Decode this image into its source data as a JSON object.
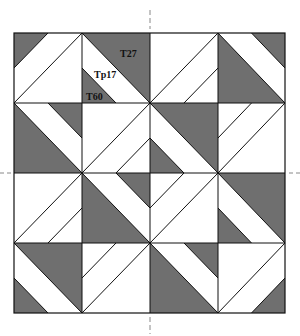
{
  "diagram": {
    "type": "quilt-block-pattern",
    "grid": {
      "rows": 4,
      "cols": 4
    },
    "bounds": {
      "x": [
        14,
        82,
        150,
        218,
        285
      ],
      "y": [
        33,
        103,
        173,
        243,
        313
      ]
    },
    "colors": {
      "dark": "#6f6f6f",
      "light": "#ffffff",
      "line": "#111111",
      "guide": "#888888"
    },
    "guides": {
      "vertical_x": 150,
      "horizontal_y": 173
    },
    "labels": [
      {
        "text": "T27",
        "x": 120,
        "y": 57
      },
      {
        "text": "Tp17",
        "x": 94,
        "y": 78
      },
      {
        "text": "T60",
        "x": 86,
        "y": 100
      }
    ],
    "cells": [
      {
        "r": 0,
        "c": 0,
        "diag": "BL-TR",
        "stripe": "TL",
        "dark_big": null,
        "dark_small": "TL"
      },
      {
        "r": 0,
        "c": 1,
        "diag": "TL-BR",
        "stripe": "BL",
        "dark_big": "TR",
        "dark_small": "BL"
      },
      {
        "r": 0,
        "c": 2,
        "diag": "BL-TR",
        "stripe": "BR",
        "dark_big": null,
        "dark_small": null
      },
      {
        "r": 0,
        "c": 3,
        "diag": "TL-BR",
        "stripe": "TR",
        "dark_big": "BL",
        "dark_small": "TR"
      },
      {
        "r": 1,
        "c": 0,
        "diag": "TL-BR",
        "stripe": "TR",
        "dark_big": "BL",
        "dark_small": "TR"
      },
      {
        "r": 1,
        "c": 1,
        "diag": "BL-TR",
        "stripe": "BR",
        "dark_big": null,
        "dark_small": null
      },
      {
        "r": 1,
        "c": 2,
        "diag": "TL-BR",
        "stripe": "BL",
        "dark_big": "TR",
        "dark_small": "BL"
      },
      {
        "r": 1,
        "c": 3,
        "diag": "BL-TR",
        "stripe": "TL",
        "dark_big": null,
        "dark_small": null
      },
      {
        "r": 2,
        "c": 0,
        "diag": "BL-TR",
        "stripe": "BR",
        "dark_big": null,
        "dark_small": null
      },
      {
        "r": 2,
        "c": 1,
        "diag": "TL-BR",
        "stripe": "TR",
        "dark_big": "BL",
        "dark_small": "TR"
      },
      {
        "r": 2,
        "c": 2,
        "diag": "BL-TR",
        "stripe": "TL",
        "dark_big": null,
        "dark_small": null
      },
      {
        "r": 2,
        "c": 3,
        "diag": "TL-BR",
        "stripe": "BL",
        "dark_big": "TR",
        "dark_small": "BL"
      },
      {
        "r": 3,
        "c": 0,
        "diag": "TL-BR",
        "stripe": "BL",
        "dark_big": "TR",
        "dark_small": "BL"
      },
      {
        "r": 3,
        "c": 1,
        "diag": "BL-TR",
        "stripe": "TL",
        "dark_big": null,
        "dark_small": null
      },
      {
        "r": 3,
        "c": 2,
        "diag": "TL-BR",
        "stripe": "TR",
        "dark_big": "BL",
        "dark_small": "TR"
      },
      {
        "r": 3,
        "c": 3,
        "diag": "BL-TR",
        "stripe": "BR",
        "dark_big": null,
        "dark_small": "BR"
      }
    ]
  }
}
